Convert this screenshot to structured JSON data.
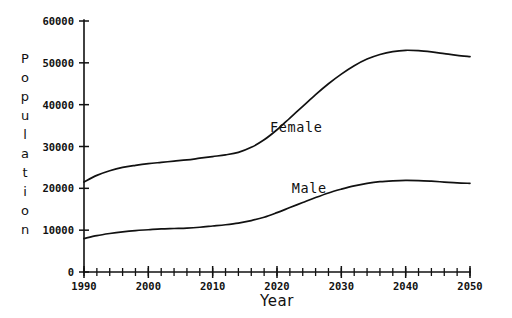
{
  "chart_data": {
    "type": "line",
    "title": "",
    "xlabel": "Year",
    "ylabel": "Population",
    "xlim": [
      1990,
      2050
    ],
    "ylim": [
      0,
      60000
    ],
    "grid": false,
    "legend_position": "inline-annotation",
    "x_ticks": [
      1990,
      2000,
      2010,
      2020,
      2030,
      2040,
      2050
    ],
    "x_tick_labels": [
      "1990",
      "2000",
      "2010",
      "2020",
      "2030",
      "2040",
      "2050"
    ],
    "x_minor_tick_step": 2,
    "y_ticks": [
      0,
      10000,
      20000,
      30000,
      40000,
      50000,
      60000
    ],
    "y_tick_labels": [
      "0",
      "10000",
      "20000",
      "30000",
      "40000",
      "50000",
      "60000"
    ],
    "x": [
      1990,
      1992,
      1994,
      1996,
      1998,
      2000,
      2002,
      2004,
      2006,
      2008,
      2010,
      2012,
      2014,
      2016,
      2018,
      2020,
      2022,
      2024,
      2026,
      2028,
      2030,
      2032,
      2034,
      2036,
      2038,
      2040,
      2042,
      2044,
      2046,
      2048,
      2050
    ],
    "series": [
      {
        "name": "Female",
        "color": "#111111",
        "values": [
          21500,
          23100,
          24200,
          25000,
          25500,
          25900,
          26200,
          26500,
          26800,
          27200,
          27600,
          28000,
          28600,
          29800,
          31600,
          34000,
          36800,
          39600,
          42400,
          45000,
          47300,
          49300,
          50900,
          52000,
          52700,
          53000,
          52900,
          52600,
          52200,
          51800,
          51500
        ]
      },
      {
        "name": "Male",
        "color": "#111111",
        "values": [
          8000,
          8700,
          9200,
          9600,
          9900,
          10100,
          10300,
          10400,
          10500,
          10700,
          11000,
          11300,
          11700,
          12300,
          13100,
          14200,
          15400,
          16600,
          17800,
          18900,
          19800,
          20600,
          21200,
          21600,
          21800,
          21900,
          21850,
          21700,
          21500,
          21300,
          21200
        ]
      }
    ],
    "annotations": [
      {
        "text": "Female",
        "x": 2023,
        "y": 33500
      },
      {
        "text": "Male",
        "x": 2025,
        "y": 19000
      }
    ]
  },
  "labels": {
    "ylabel_letters": [
      "P",
      "o",
      "p",
      "u",
      "l",
      "a",
      "t",
      "i",
      "o",
      "n"
    ],
    "xlabel": "Year"
  }
}
